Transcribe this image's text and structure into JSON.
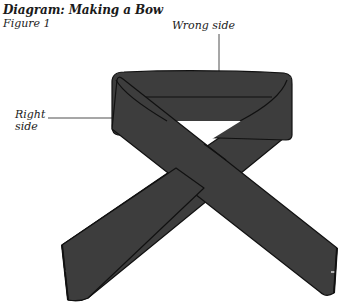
{
  "header": {
    "title": "Diagram: Making a Bow",
    "subtitle": "Figure 1"
  },
  "labels": {
    "wrong_side": "Wrong side",
    "right_side_line1": "Right",
    "right_side_line2": "side"
  },
  "colors": {
    "ribbon": "#3d3d3d",
    "outline": "#111111",
    "background": "#ffffff"
  }
}
